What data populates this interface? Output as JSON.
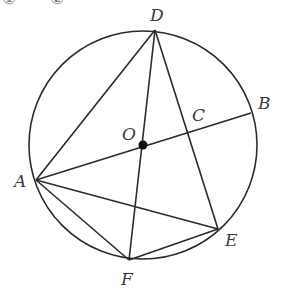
{
  "diagram": {
    "type": "circle-geometry",
    "stroke_color": "#2a2a2a",
    "label_color": "#3a3a3a",
    "circle": {
      "center": "O",
      "cx": 143,
      "cy": 145,
      "r": 114
    },
    "points": {
      "O": {
        "x": 143,
        "y": 145,
        "label": "O",
        "lx": 122,
        "ly": 140
      },
      "D": {
        "x": 155,
        "y": 30,
        "label": "D",
        "lx": 150,
        "ly": 21
      },
      "B": {
        "x": 251,
        "y": 113,
        "label": "B",
        "lx": 258,
        "ly": 109
      },
      "C": {
        "x": 190,
        "y": 129,
        "label": "C",
        "lx": 192,
        "ly": 121
      },
      "A": {
        "x": 36,
        "y": 180,
        "label": "A",
        "lx": 14,
        "ly": 187
      },
      "F": {
        "x": 129,
        "y": 260,
        "label": "F",
        "lx": 121,
        "ly": 285
      },
      "E": {
        "x": 218,
        "y": 229,
        "label": "E",
        "lx": 225,
        "ly": 246
      }
    },
    "segments": [
      [
        "A",
        "B"
      ],
      [
        "D",
        "A"
      ],
      [
        "D",
        "F"
      ],
      [
        "D",
        "E"
      ],
      [
        "A",
        "E"
      ],
      [
        "A",
        "F"
      ],
      [
        "F",
        "E"
      ]
    ],
    "center_dot": {
      "x": 143,
      "y": 145,
      "r": 4.5
    },
    "top_cropped_text": "① ②"
  }
}
